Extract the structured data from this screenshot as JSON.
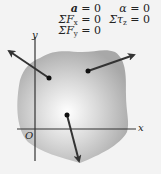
{
  "equations": {
    "left": [
      {
        "lhs": "a",
        "rhs": "= 0"
      },
      {
        "lhs": "ΣF",
        "sub": "x",
        "rhs": "= 0"
      },
      {
        "lhs": "ΣF",
        "sub": "y",
        "rhs": "= 0"
      }
    ],
    "right": [
      {
        "lhs": "α",
        "rhs": "= 0"
      },
      {
        "lhs": "Στ",
        "sub": "z",
        "rhs": "= 0"
      }
    ]
  },
  "axes": {
    "x_label": "x",
    "y_label": "y",
    "origin_label": "O"
  },
  "body": {
    "fill_center": "#ffffff",
    "fill_edge": "#a9a9a9"
  },
  "forces": [
    {
      "name": "force-1",
      "from": [
        49,
        78
      ],
      "to": [
        8,
        50
      ]
    },
    {
      "name": "force-2",
      "from": [
        88,
        71
      ],
      "to": [
        136,
        54
      ]
    },
    {
      "name": "force-3",
      "from": [
        67,
        115
      ],
      "to": [
        80,
        163
      ]
    }
  ]
}
